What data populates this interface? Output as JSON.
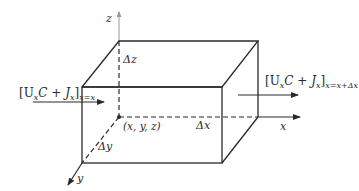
{
  "diagram": {
    "type": "control-volume-box",
    "axes": {
      "x_label": "x",
      "y_label": "y",
      "z_label": "z"
    },
    "dimensions": {
      "dx": "Δx",
      "dy": "Δy",
      "dz": "Δz"
    },
    "origin_label": "(x, y, z)",
    "flux_in": {
      "bracket": "[U",
      "sub_x1": "x",
      "mid": "C + J",
      "sub_x2": "x",
      "close": "]",
      "eval": "x=x"
    },
    "flux_out": {
      "bracket": "[U",
      "sub_x1": "x",
      "mid": "C + J",
      "sub_x2": "x",
      "close": "]",
      "eval": "x=x+Δx"
    },
    "colors": {
      "line": "#2a2a2a",
      "axis_light": "#9a9a9a"
    }
  }
}
